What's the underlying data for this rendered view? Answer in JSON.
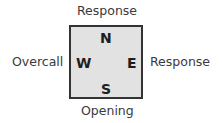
{
  "diagram": {
    "type": "bridge-table-positions",
    "colors": {
      "table_fill": "#e2e2e2",
      "table_border": "#333333",
      "label_text": "#3a3a3a",
      "seat_text": "#1e1e1e"
    },
    "seats": {
      "north": "N",
      "west": "W",
      "east": "E",
      "south": "S"
    },
    "labels": {
      "north": "Response",
      "west": "Overcall",
      "east": "Response",
      "south": "Opening"
    }
  }
}
